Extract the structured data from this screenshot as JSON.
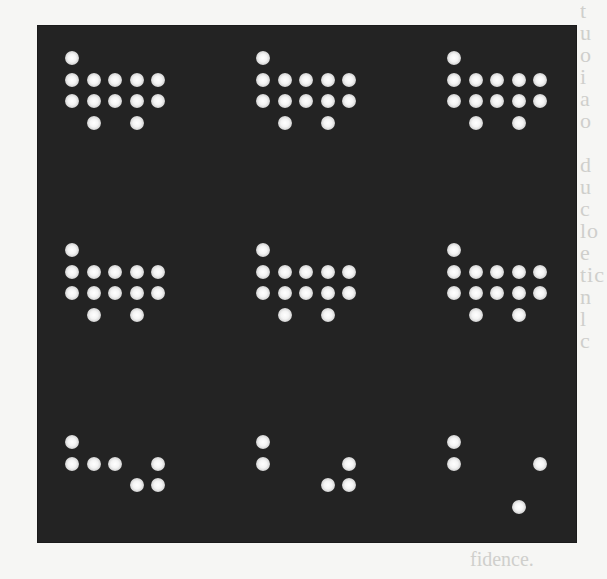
{
  "figure": {
    "panel_color": "#232323",
    "dot_color": "#ffffff",
    "grid": {
      "rows": 3,
      "cols": 3
    },
    "matrix_size": {
      "cols": 5,
      "rows": 4
    },
    "patterns": [
      {
        "id": "r1c1",
        "dots": [
          [
            0,
            0
          ],
          [
            0,
            1
          ],
          [
            1,
            1
          ],
          [
            2,
            1
          ],
          [
            3,
            1
          ],
          [
            4,
            1
          ],
          [
            0,
            2
          ],
          [
            1,
            2
          ],
          [
            2,
            2
          ],
          [
            3,
            2
          ],
          [
            4,
            2
          ],
          [
            1,
            3
          ],
          [
            3,
            3
          ]
        ]
      },
      {
        "id": "r1c2",
        "dots": [
          [
            0,
            0
          ],
          [
            0,
            1
          ],
          [
            1,
            1
          ],
          [
            2,
            1
          ],
          [
            3,
            1
          ],
          [
            4,
            1
          ],
          [
            0,
            2
          ],
          [
            1,
            2
          ],
          [
            2,
            2
          ],
          [
            3,
            2
          ],
          [
            4,
            2
          ],
          [
            1,
            3
          ],
          [
            3,
            3
          ]
        ]
      },
      {
        "id": "r1c3",
        "dots": [
          [
            0,
            0
          ],
          [
            0,
            1
          ],
          [
            1,
            1
          ],
          [
            2,
            1
          ],
          [
            3,
            1
          ],
          [
            4,
            1
          ],
          [
            0,
            2
          ],
          [
            1,
            2
          ],
          [
            2,
            2
          ],
          [
            3,
            2
          ],
          [
            4,
            2
          ],
          [
            1,
            3
          ],
          [
            3,
            3
          ]
        ]
      },
      {
        "id": "r2c1",
        "dots": [
          [
            0,
            0
          ],
          [
            0,
            1
          ],
          [
            1,
            1
          ],
          [
            2,
            1
          ],
          [
            3,
            1
          ],
          [
            4,
            1
          ],
          [
            0,
            2
          ],
          [
            1,
            2
          ],
          [
            2,
            2
          ],
          [
            3,
            2
          ],
          [
            4,
            2
          ],
          [
            1,
            3
          ],
          [
            3,
            3
          ]
        ]
      },
      {
        "id": "r2c2",
        "dots": [
          [
            0,
            0
          ],
          [
            0,
            1
          ],
          [
            1,
            1
          ],
          [
            2,
            1
          ],
          [
            3,
            1
          ],
          [
            4,
            1
          ],
          [
            0,
            2
          ],
          [
            1,
            2
          ],
          [
            2,
            2
          ],
          [
            3,
            2
          ],
          [
            4,
            2
          ],
          [
            1,
            3
          ],
          [
            3,
            3
          ]
        ]
      },
      {
        "id": "r2c3",
        "dots": [
          [
            0,
            0
          ],
          [
            0,
            1
          ],
          [
            1,
            1
          ],
          [
            2,
            1
          ],
          [
            3,
            1
          ],
          [
            4,
            1
          ],
          [
            0,
            2
          ],
          [
            1,
            2
          ],
          [
            2,
            2
          ],
          [
            3,
            2
          ],
          [
            4,
            2
          ],
          [
            1,
            3
          ],
          [
            3,
            3
          ]
        ]
      },
      {
        "id": "r3c1",
        "dots": [
          [
            0,
            0
          ],
          [
            0,
            1
          ],
          [
            1,
            1
          ],
          [
            2,
            1
          ],
          [
            4,
            1
          ],
          [
            3,
            2
          ],
          [
            4,
            2
          ]
        ]
      },
      {
        "id": "r3c2",
        "dots": [
          [
            0,
            0
          ],
          [
            0,
            1
          ],
          [
            4,
            1
          ],
          [
            3,
            2
          ],
          [
            4,
            2
          ]
        ]
      },
      {
        "id": "r3c3",
        "dots": [
          [
            0,
            0
          ],
          [
            0,
            1
          ],
          [
            4,
            1
          ],
          [
            3,
            3
          ]
        ]
      }
    ]
  },
  "page_bleed": {
    "right_margin": "t\nu\no\ni\na\no\n\nd\nu\nc\nlo\ne\ntic\nn\nl\nc",
    "bottom": "fidence."
  }
}
